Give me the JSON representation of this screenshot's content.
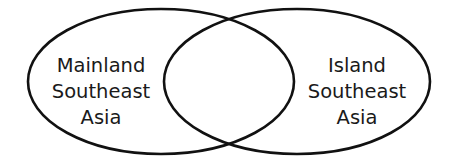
{
  "diagram": {
    "type": "venn",
    "stroke_color": "#111111",
    "background": "#ffffff",
    "sets": [
      {
        "name": "left",
        "lines": [
          "Mainland",
          "Southeast",
          "Asia"
        ]
      },
      {
        "name": "right",
        "lines": [
          "Island",
          "Southeast",
          "Asia"
        ]
      }
    ],
    "intersection_label": ""
  }
}
